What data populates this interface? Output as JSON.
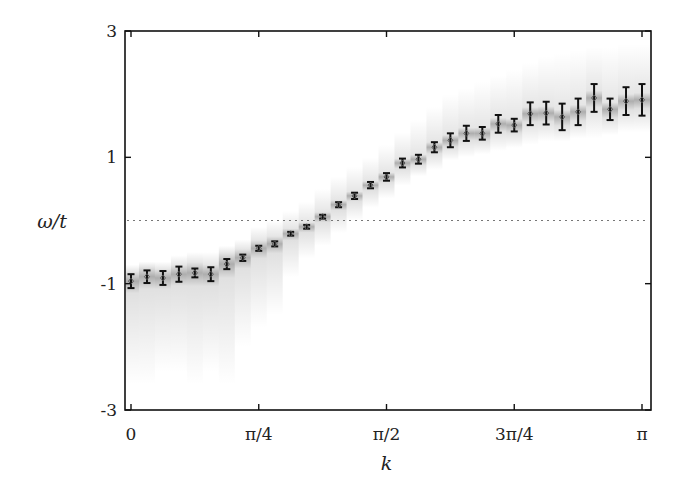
{
  "chart_data": {
    "type": "scatter",
    "title": "",
    "xlabel": "k",
    "ylabel": "ω/t",
    "xlim": [
      0,
      3.14159
    ],
    "ylim": [
      -3,
      3
    ],
    "grid": false,
    "legend": null,
    "x_ticks": [
      {
        "value": 0,
        "label": "0"
      },
      {
        "value": 0.785398,
        "label": "π/4"
      },
      {
        "value": 1.570796,
        "label": "π/2"
      },
      {
        "value": 2.356194,
        "label": "3π/4"
      },
      {
        "value": 3.141593,
        "label": "π"
      }
    ],
    "y_ticks": [
      {
        "value": 3,
        "label": "3"
      },
      {
        "value": 1,
        "label": "1"
      },
      {
        "value": -1,
        "label": "-1"
      },
      {
        "value": -3,
        "label": "-3"
      }
    ],
    "reference_line": {
      "y": 0,
      "style": "dotted"
    },
    "series": [
      {
        "name": "dispersion",
        "x_unit": "k = n·π/32, n = 0..32",
        "n": [
          0,
          1,
          2,
          3,
          4,
          5,
          6,
          7,
          8,
          9,
          10,
          11,
          12,
          13,
          14,
          15,
          16,
          17,
          18,
          19,
          20,
          21,
          22,
          23,
          24,
          25,
          26,
          27,
          28,
          29,
          30,
          31,
          32
        ],
        "values": [
          -0.96,
          -0.89,
          -0.91,
          -0.85,
          -0.83,
          -0.85,
          -0.69,
          -0.59,
          -0.44,
          -0.37,
          -0.21,
          -0.1,
          0.06,
          0.25,
          0.39,
          0.56,
          0.69,
          0.91,
          0.97,
          1.16,
          1.27,
          1.38,
          1.38,
          1.53,
          1.51,
          1.69,
          1.7,
          1.64,
          1.72,
          1.94,
          1.76,
          1.89,
          1.91
        ],
        "errors": [
          0.11,
          0.1,
          0.11,
          0.12,
          0.07,
          0.11,
          0.08,
          0.05,
          0.04,
          0.04,
          0.03,
          0.03,
          0.03,
          0.04,
          0.05,
          0.05,
          0.06,
          0.07,
          0.07,
          0.08,
          0.11,
          0.12,
          0.1,
          0.14,
          0.1,
          0.18,
          0.18,
          0.21,
          0.21,
          0.22,
          0.17,
          0.22,
          0.25
        ]
      }
    ],
    "spectral_shading": {
      "description": "gray spectral-weight columns around each point",
      "lower_extent": [
        -2.6,
        -2.6,
        -2.4,
        -2.4,
        -2.6,
        -2.4,
        -2.6,
        -2.0,
        -1.7,
        -1.5,
        -0.9,
        -0.6,
        -0.4,
        -0.2,
        0.0,
        0.2,
        0.35,
        0.55,
        0.7,
        0.8,
        0.95,
        1.0,
        1.05,
        1.1,
        1.15,
        1.2,
        1.25,
        1.25,
        1.3,
        1.3,
        1.35,
        1.4,
        1.4
      ],
      "upper_extent": [
        -0.7,
        -0.65,
        -0.65,
        -0.55,
        -0.5,
        -0.5,
        -0.4,
        -0.3,
        -0.1,
        0.0,
        0.15,
        0.3,
        0.5,
        0.7,
        0.85,
        1.0,
        1.2,
        1.4,
        1.6,
        1.8,
        2.0,
        2.1,
        2.2,
        2.3,
        2.4,
        2.5,
        2.6,
        2.65,
        2.7,
        2.75,
        2.75,
        2.8,
        2.8
      ]
    }
  }
}
